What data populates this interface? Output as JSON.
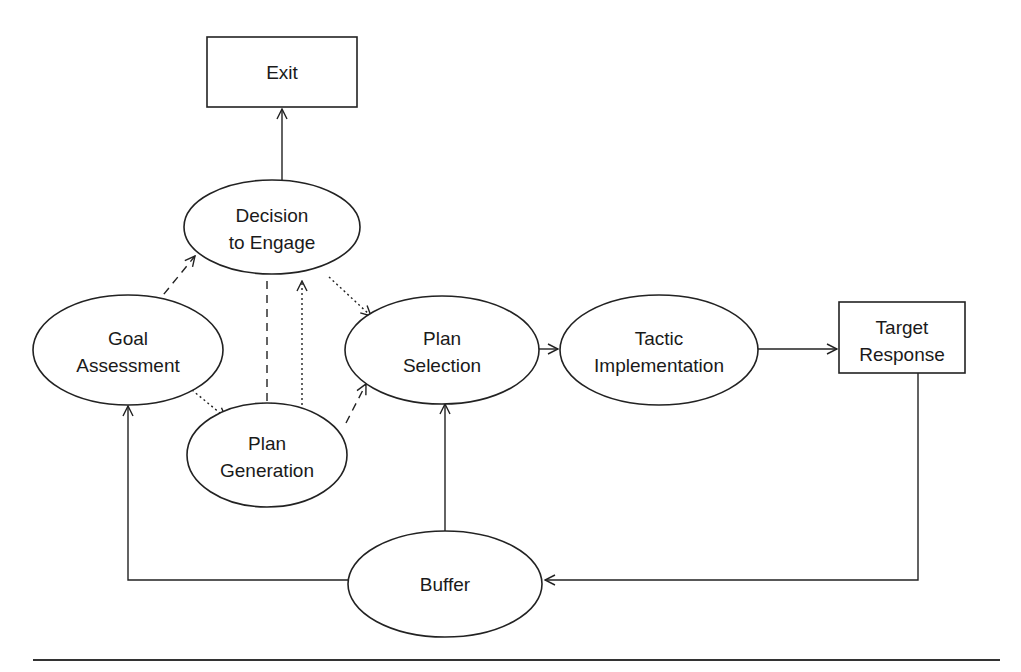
{
  "diagram": {
    "nodes": {
      "exit": {
        "shape": "rectangle",
        "lines": [
          "Exit"
        ]
      },
      "decision_to_engage": {
        "shape": "ellipse",
        "lines": [
          "Decision",
          "to Engage"
        ]
      },
      "goal_assessment": {
        "shape": "ellipse",
        "lines": [
          "Goal",
          "Assessment"
        ]
      },
      "plan_selection": {
        "shape": "ellipse",
        "lines": [
          "Plan",
          "Selection"
        ]
      },
      "tactic_implementation": {
        "shape": "ellipse",
        "lines": [
          "Tactic",
          "Implementation"
        ]
      },
      "target_response": {
        "shape": "rectangle",
        "lines": [
          "Target",
          "Response"
        ]
      },
      "plan_generation": {
        "shape": "ellipse",
        "lines": [
          "Plan",
          "Generation"
        ]
      },
      "buffer": {
        "shape": "ellipse",
        "lines": [
          "Buffer"
        ]
      }
    },
    "edges": [
      {
        "from": "Decision to Engage",
        "to": "Exit",
        "style": "solid"
      },
      {
        "from": "Goal Assessment",
        "to": "Decision to Engage",
        "style": "dashed"
      },
      {
        "from": "Goal Assessment",
        "to": "Plan Generation",
        "style": "dotted"
      },
      {
        "from": "Decision to Engage",
        "to": "Plan Generation",
        "style": "dashed"
      },
      {
        "from": "Plan Generation",
        "to": "Decision to Engage",
        "style": "dotted"
      },
      {
        "from": "Decision to Engage",
        "to": "Plan Selection",
        "style": "dotted"
      },
      {
        "from": "Plan Generation",
        "to": "Plan Selection",
        "style": "dashed"
      },
      {
        "from": "Plan Selection",
        "to": "Tactic Implementation",
        "style": "solid"
      },
      {
        "from": "Tactic Implementation",
        "to": "Target Response",
        "style": "solid"
      },
      {
        "from": "Target Response",
        "to": "Buffer",
        "style": "solid"
      },
      {
        "from": "Buffer",
        "to": "Plan Selection",
        "style": "solid"
      },
      {
        "from": "Buffer",
        "to": "Goal Assessment",
        "style": "solid"
      }
    ],
    "colors": {
      "stroke": "#222222",
      "text": "#1a1a1a",
      "background": "#ffffff"
    }
  }
}
